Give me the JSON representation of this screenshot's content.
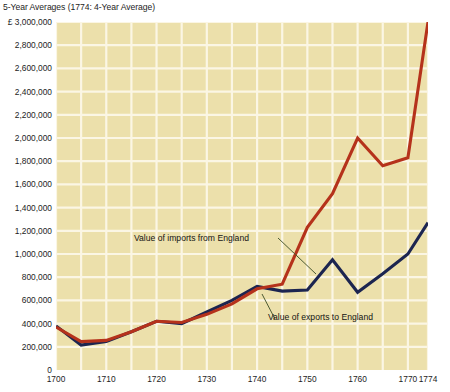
{
  "chart_title": "5-Year Averages (1774: 4-Year Average)",
  "axis": {
    "y_unit_prefix": "£",
    "y_ticks": [
      {
        "label": "£ 3,000,000",
        "value": 3000000
      },
      {
        "label": "2,800,000",
        "value": 2800000
      },
      {
        "label": "2,600,000",
        "value": 2600000
      },
      {
        "label": "2,400,000",
        "value": 2400000
      },
      {
        "label": "2,200,000",
        "value": 2200000
      },
      {
        "label": "2,000,000",
        "value": 2000000
      },
      {
        "label": "1,800,000",
        "value": 1800000
      },
      {
        "label": "1,600,000",
        "value": 1600000
      },
      {
        "label": "1,400,000",
        "value": 1400000
      },
      {
        "label": "1,200,000",
        "value": 1200000
      },
      {
        "label": "1,000,000",
        "value": 1000000
      },
      {
        "label": "800,000",
        "value": 800000
      },
      {
        "label": "600,000",
        "value": 600000
      },
      {
        "label": "400,000",
        "value": 400000
      },
      {
        "label": "200,000",
        "value": 200000
      },
      {
        "label": "0",
        "value": 0
      }
    ],
    "x_ticks": [
      {
        "label": "1700",
        "value": 1700
      },
      {
        "label": "1710",
        "value": 1710
      },
      {
        "label": "1720",
        "value": 1720
      },
      {
        "label": "1730",
        "value": 1730
      },
      {
        "label": "1740",
        "value": 1740
      },
      {
        "label": "1750",
        "value": 1750
      },
      {
        "label": "1760",
        "value": 1760
      },
      {
        "label": "1770",
        "value": 1770
      },
      {
        "label": "1774",
        "value": 1774
      }
    ]
  },
  "annotations": {
    "imports_label": "Value of imports from England",
    "exports_label": "Value of exports to England"
  },
  "colors": {
    "plot_background": "#ece0ab",
    "gridline": "#fbf6e4",
    "imports_line": "#b5321b",
    "exports_line": "#1c2550",
    "leader_line": "#4d5b33",
    "page_background": "#ffffff",
    "text": "#1b1b1b"
  },
  "chart_data": {
    "type": "line",
    "title": "5-Year Averages (1774: 4-Year Average)",
    "xlabel": "",
    "ylabel": "£",
    "xlim": [
      1700,
      1774
    ],
    "ylim": [
      0,
      3000000
    ],
    "grid": true,
    "legend": "annotated-inline",
    "x": [
      1700,
      1705,
      1710,
      1715,
      1720,
      1725,
      1730,
      1735,
      1740,
      1745,
      1750,
      1755,
      1760,
      1765,
      1770,
      1774
    ],
    "series": [
      {
        "name": "Value of imports from England",
        "color": "#b5321b",
        "values": [
          370000,
          245000,
          255000,
          330000,
          420000,
          410000,
          480000,
          570000,
          700000,
          740000,
          1230000,
          1520000,
          2000000,
          1760000,
          1830000,
          3000000
        ]
      },
      {
        "name": "Value of exports to England",
        "color": "#1c2550",
        "values": [
          380000,
          215000,
          245000,
          330000,
          420000,
          400000,
          500000,
          600000,
          720000,
          680000,
          690000,
          950000,
          670000,
          830000,
          1000000,
          1270000
        ]
      }
    ]
  }
}
